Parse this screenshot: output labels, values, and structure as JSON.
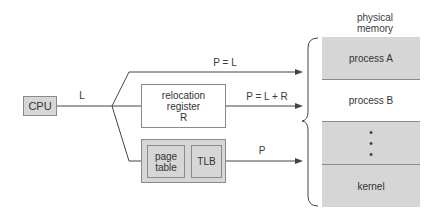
{
  "diagram": {
    "cpu": {
      "label": "CPU"
    },
    "logical_address": {
      "label": "L"
    },
    "top_path": {
      "label": "P = L"
    },
    "relocation": {
      "line1": "relocation",
      "line2": "register",
      "line3": "R",
      "output_label": "P = L + R"
    },
    "paging": {
      "page_table_line1": "page",
      "page_table_line2": "table",
      "tlb": "TLB",
      "output_label": "P"
    },
    "memory": {
      "title_line1": "physical",
      "title_line2": "memory",
      "segments": [
        "process A",
        "process B",
        "•\n•\n•",
        "kernel"
      ],
      "colors": {
        "gray": "#d6d6d6",
        "white": "#ffffff"
      }
    }
  }
}
